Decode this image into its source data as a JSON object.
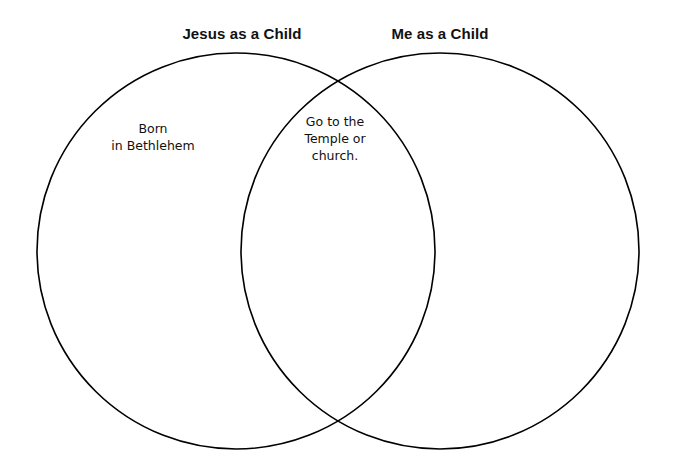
{
  "diagram": {
    "type": "venn-diagram",
    "set_count": 2,
    "background_color": "#ffffff",
    "stroke_color": "#000000",
    "stroke_width": 1.6,
    "headings": {
      "left": "Jesus as a Child",
      "right": "Me as a Child"
    },
    "regions": {
      "left_only": {
        "label": "left-circle-content",
        "lines": [
          "Born",
          "in Bethlehem"
        ]
      },
      "overlap": {
        "label": "overlap-content",
        "lines": [
          "Go to the",
          "Temple or",
          "church."
        ]
      },
      "right_only": {
        "label": "right-circle-content",
        "lines": []
      }
    },
    "circles": [
      {
        "name": "left-circle",
        "cx": 236,
        "cy": 251,
        "rx": 199,
        "ry": 198
      },
      {
        "name": "right-circle",
        "cx": 440,
        "cy": 251,
        "rx": 199,
        "ry": 198
      }
    ]
  }
}
